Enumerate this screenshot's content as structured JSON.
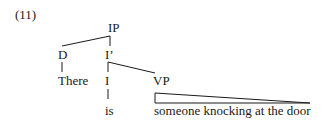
{
  "example_number": "(11)",
  "tree": {
    "root": {
      "label": "IP"
    },
    "spec": {
      "label": "D",
      "leaf": "There"
    },
    "ibar": {
      "label": "I’"
    },
    "head": {
      "label": "I",
      "leaf": "is"
    },
    "complement": {
      "label": "VP",
      "leaf": "someone knocking at the door",
      "rendering": "triangle"
    }
  },
  "colors": {
    "line": "#1a1a1a",
    "text": "#1a1a1a",
    "background": "#ffffff"
  }
}
